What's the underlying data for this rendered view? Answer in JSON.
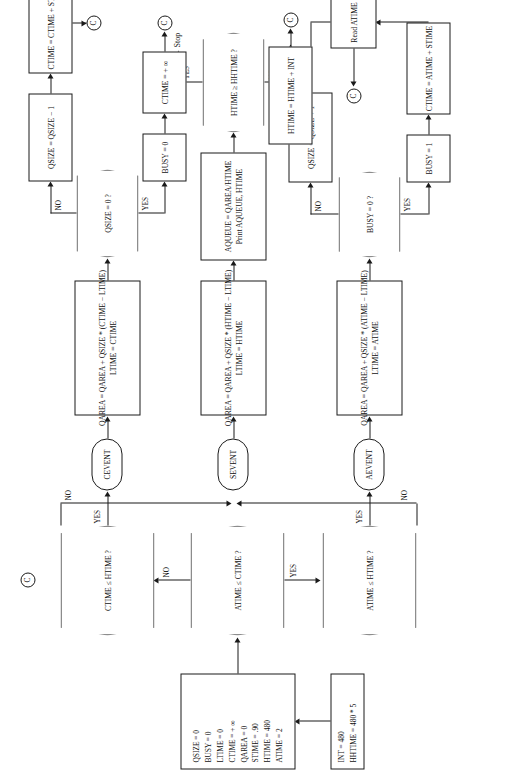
{
  "figure": {
    "kind": "flowchart",
    "orientation": "rotated-90-ccw",
    "stroke_color": "#1a1a1a",
    "background_color": "#ffffff"
  },
  "chart_data": {
    "type": "diagram",
    "title": "",
    "nodes": [
      {
        "id": "int",
        "shape": "process",
        "lines": [
          "INT = 480",
          "HHTIME = 480 * 5"
        ]
      },
      {
        "id": "init",
        "shape": "process",
        "lines": [
          "QSIZE = 0",
          "BUSY = 0",
          "LTIME = 0",
          "CTIME = + ∞",
          "QAREA = 0",
          "STIME = .90",
          "HTIME = 480",
          "ATIME = 2"
        ]
      },
      {
        "id": "d1",
        "shape": "decision",
        "text": "ATIME ≤ CTIME ?"
      },
      {
        "id": "d2",
        "shape": "decision",
        "text": "ATIME ≤ HTIME ?"
      },
      {
        "id": "d3",
        "shape": "decision",
        "text": "CTIME ≤ HTIME ?"
      },
      {
        "id": "aevent",
        "shape": "terminal",
        "text": "AEVENT"
      },
      {
        "id": "sevent",
        "shape": "terminal",
        "text": "SEVENT"
      },
      {
        "id": "cevent",
        "shape": "terminal",
        "text": "CEVENT"
      },
      {
        "id": "a1",
        "shape": "process",
        "lines": [
          "QAREA = QAREA + QSIZE * (ATIME − LTIME)",
          "LTIME = ATIME"
        ]
      },
      {
        "id": "a2",
        "shape": "decision",
        "text": "BUSY = 0 ?"
      },
      {
        "id": "a3",
        "shape": "process",
        "lines": [
          "BUSY = 1"
        ]
      },
      {
        "id": "a4",
        "shape": "process",
        "lines": [
          "CTIME = ATIME + STIME"
        ]
      },
      {
        "id": "a5",
        "shape": "process",
        "lines": [
          "QSIZE = QSIZE + 1"
        ]
      },
      {
        "id": "a6",
        "shape": "process",
        "lines": [
          "Read ATIME"
        ]
      },
      {
        "id": "s1",
        "shape": "process",
        "lines": [
          "QAREA = QAREA + QSIZE * (HTIME − LTIME)",
          "LTIME = HTIME"
        ]
      },
      {
        "id": "s2",
        "shape": "process",
        "lines": [
          "AQUEUE = QAREA/HTIME",
          "Print AQUEUE, HTIME"
        ]
      },
      {
        "id": "s3",
        "shape": "decision",
        "text": "HTIME ≥ HHTIME ?"
      },
      {
        "id": "s4",
        "shape": "process",
        "lines": [
          "HTIME = HTIME + INT"
        ]
      },
      {
        "id": "stop",
        "shape": "text",
        "text": "Stop"
      },
      {
        "id": "c1",
        "shape": "process",
        "lines": [
          "QAREA = QAREA + QSIZE * (CTIME − LTIME)",
          "LTIME = CTIME"
        ]
      },
      {
        "id": "c2",
        "shape": "decision",
        "text": "QSIZE = 0 ?"
      },
      {
        "id": "c3",
        "shape": "process",
        "lines": [
          "BUSY = 0"
        ]
      },
      {
        "id": "c4",
        "shape": "process",
        "lines": [
          "CTIME = + ∞"
        ]
      },
      {
        "id": "c5",
        "shape": "process",
        "lines": [
          "QSIZE = QSIZE − 1"
        ]
      },
      {
        "id": "c6",
        "shape": "process",
        "lines": [
          "CTIME = CTIME + STIME"
        ]
      },
      {
        "id": "conn",
        "shape": "connector",
        "text": "C"
      }
    ],
    "edges": [
      {
        "from": "int",
        "to": "init",
        "label": ""
      },
      {
        "from": "init",
        "to": "d1",
        "label": ""
      },
      {
        "from": "d1",
        "to": "d2",
        "label": "YES"
      },
      {
        "from": "d1",
        "to": "d3",
        "label": "NO"
      },
      {
        "from": "d2",
        "to": "aevent",
        "label": "YES"
      },
      {
        "from": "d2",
        "to": "sevent",
        "label": "NO"
      },
      {
        "from": "d3",
        "to": "cevent",
        "label": "YES"
      },
      {
        "from": "d3",
        "to": "sevent",
        "label": "NO"
      },
      {
        "from": "aevent",
        "to": "a1",
        "label": ""
      },
      {
        "from": "a1",
        "to": "a2",
        "label": ""
      },
      {
        "from": "a2",
        "to": "a3",
        "label": "YES"
      },
      {
        "from": "a2",
        "to": "a5",
        "label": "NO"
      },
      {
        "from": "a3",
        "to": "a4",
        "label": ""
      },
      {
        "from": "a4",
        "to": "a6",
        "label": ""
      },
      {
        "from": "a5",
        "to": "a6",
        "label": ""
      },
      {
        "from": "a6",
        "to": "conn",
        "label": ""
      },
      {
        "from": "sevent",
        "to": "s1",
        "label": ""
      },
      {
        "from": "s1",
        "to": "s2",
        "label": ""
      },
      {
        "from": "s2",
        "to": "s3",
        "label": ""
      },
      {
        "from": "s3",
        "to": "stop",
        "label": "YES"
      },
      {
        "from": "s3",
        "to": "s4",
        "label": "NO"
      },
      {
        "from": "s4",
        "to": "conn",
        "label": ""
      },
      {
        "from": "cevent",
        "to": "c1",
        "label": ""
      },
      {
        "from": "c1",
        "to": "c2",
        "label": ""
      },
      {
        "from": "c2",
        "to": "c3",
        "label": "YES"
      },
      {
        "from": "c2",
        "to": "c5",
        "label": "NO"
      },
      {
        "from": "c3",
        "to": "c4",
        "label": ""
      },
      {
        "from": "c4",
        "to": "conn",
        "label": ""
      },
      {
        "from": "c5",
        "to": "c6",
        "label": ""
      },
      {
        "from": "c6",
        "to": "conn",
        "label": ""
      }
    ]
  },
  "nodes": {
    "int": {
      "l1": "INT = 480",
      "l2": "HHTIME = 480 * 5"
    },
    "init": {
      "l1": "QSIZE = 0",
      "l2": "BUSY = 0",
      "l3": "LTIME = 0",
      "l4": "CTIME = + ∞",
      "l5": "QAREA = 0",
      "l6": "STIME = .90",
      "l7": "HTIME = 480",
      "l8": "ATIME = 2"
    },
    "d1": "ATIME ≤ CTIME ?",
    "d2": "ATIME ≤ HTIME ?",
    "d3": "CTIME ≤ HTIME ?",
    "aevent": "AEVENT",
    "sevent": "SEVENT",
    "cevent": "CEVENT",
    "a1": {
      "l1": "QAREA = QAREA + QSIZE * (ATIME − LTIME)",
      "l2": "LTIME = ATIME"
    },
    "a2": "BUSY = 0 ?",
    "a3": "BUSY = 1",
    "a4": "CTIME = ATIME + STIME",
    "a5": "QSIZE = QSIZE + 1",
    "a6": "Read ATIME",
    "s1": {
      "l1": "QAREA = QAREA + QSIZE * (HTIME − LTIME)",
      "l2": "LTIME = HTIME"
    },
    "s2": {
      "l1": "AQUEUE = QAREA/HTIME",
      "l2": "Print AQUEUE, HTIME"
    },
    "s3": "HTIME ≥ HHTIME ?",
    "s4": "HTIME = HTIME + INT",
    "stop": "Stop",
    "c1": {
      "l1": "QAREA = QAREA + QSIZE * (CTIME − LTIME)",
      "l2": "LTIME = CTIME"
    },
    "c2": "QSIZE = 0 ?",
    "c3": "BUSY = 0",
    "c4": "CTIME = + ∞",
    "c5": "QSIZE = QSIZE − 1",
    "c6": "CTIME = CTIME + STIME",
    "connector": "C"
  },
  "labels": {
    "yes": "YES",
    "no": "NO"
  }
}
